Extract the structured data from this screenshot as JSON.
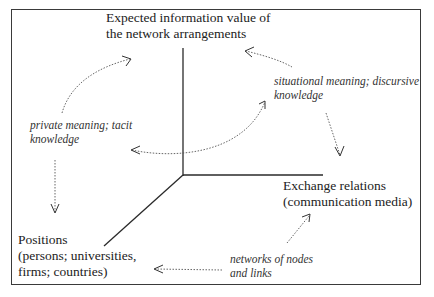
{
  "axes": {
    "vertical": {
      "line1": "Expected information value of",
      "line2": "the network arrangements"
    },
    "horizontal": {
      "line1": "Exchange relations",
      "line2": "(communication media)"
    },
    "diagonal": {
      "line1": "Positions",
      "line2": "(persons; universities,",
      "line3": "firms; countries)"
    }
  },
  "annotations": {
    "private": {
      "line1": "private meaning; tacit",
      "line2": "knowledge"
    },
    "situational": {
      "line1": "situational meaning; discursive",
      "line2": "knowledge"
    },
    "networks": {
      "line1": "networks of nodes",
      "line2": "and links"
    }
  },
  "colors": {
    "axis": "#2a2a2a",
    "arrow": "#555555",
    "border": "#3a3a3a"
  }
}
